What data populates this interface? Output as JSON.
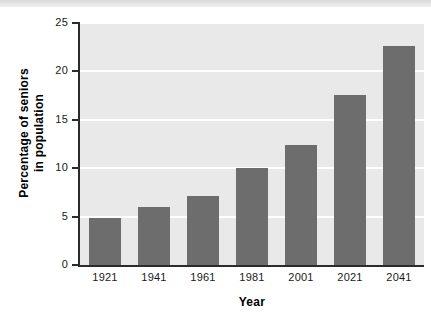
{
  "figure": {
    "top_banner": "",
    "background_color": "#ffffff",
    "plot_background_color": "#e9e9e9",
    "gridline_color": "#ffffff",
    "axis_color": "#2b2b2b",
    "bar_color": "#6d6d6d"
  },
  "axis": {
    "y_title_line1": "Percentage of seniors",
    "y_title_line2": "in population",
    "x_title": "Year",
    "y_ticks": [
      "25",
      "20",
      "15",
      "10",
      "5",
      "0"
    ],
    "x_ticks": [
      "1921",
      "1941",
      "1961",
      "1981",
      "2001",
      "2021",
      "2041"
    ]
  },
  "chart_data": {
    "type": "bar",
    "title": "",
    "subtitle": "",
    "categories": [
      "1921",
      "1941",
      "1961",
      "1981",
      "2001",
      "2021",
      "2041"
    ],
    "values": [
      4.9,
      6.0,
      7.1,
      10.0,
      12.4,
      17.6,
      22.6
    ],
    "xlabel": "Year",
    "ylabel": "Percentage of seniors in population",
    "ylim": [
      0,
      25
    ],
    "ytick_values": [
      0,
      5,
      10,
      15,
      20,
      25
    ],
    "xtick_labels": [
      "1921",
      "1941",
      "1961",
      "1981",
      "2001",
      "2021",
      "2041"
    ],
    "grid": "horizontal",
    "legend": "none",
    "series": [
      {
        "name": "Percentage of seniors in population",
        "values": [
          4.9,
          6.0,
          7.1,
          10.0,
          12.4,
          17.6,
          22.6
        ],
        "color": "#6d6d6d"
      }
    ],
    "annotations": []
  }
}
